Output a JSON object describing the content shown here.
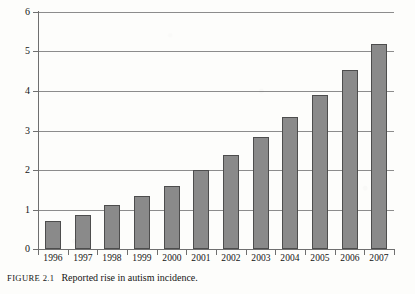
{
  "figure": {
    "caption_number": "FIGURE 2.1",
    "caption_text": "Reported rise in autism incidence."
  },
  "colors": {
    "bar_fill": "#8a8a8a",
    "bar_edge": "#4d4d4d",
    "gridline": "#8c8c8c",
    "axis": "#6f6f6f",
    "text": "#141414",
    "background": "#fdfdfb"
  },
  "chart_data": {
    "type": "bar",
    "title": "Reported rise in autism incidence.",
    "xlabel": "",
    "ylabel": "",
    "ylim": [
      0,
      6
    ],
    "yticks": [
      0,
      1,
      2,
      3,
      4,
      5,
      6
    ],
    "ytick_labels": [
      "0",
      "1",
      "2",
      "3",
      "4",
      "5",
      "6"
    ],
    "grid": true,
    "legend": false,
    "categories": [
      "1996",
      "1997",
      "1998",
      "1999",
      "2000",
      "2001",
      "2002",
      "2003",
      "2004",
      "2005",
      "2006",
      "2007"
    ],
    "values": [
      0.7,
      0.85,
      1.12,
      1.35,
      1.6,
      2.0,
      2.38,
      2.84,
      3.34,
      3.9,
      4.53,
      5.2
    ]
  }
}
